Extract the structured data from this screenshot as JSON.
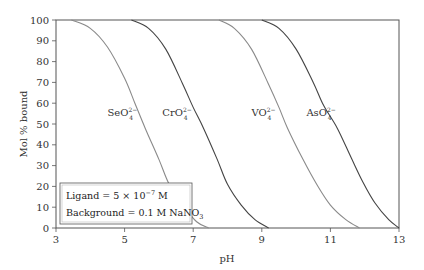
{
  "chart_data": {
    "type": "line",
    "title": "",
    "xlabel": "pH",
    "ylabel": "Mol % bound",
    "xlim": [
      3,
      13
    ],
    "ylim": [
      0,
      100
    ],
    "xticks": [
      3,
      5,
      7,
      9,
      11,
      13
    ],
    "yticks": [
      0,
      10,
      20,
      30,
      40,
      50,
      60,
      70,
      80,
      90,
      100
    ],
    "grid": false,
    "series": [
      {
        "name": "SeO4 2-",
        "label_main": "SeO",
        "label_sub": "4",
        "label_sup": "2−",
        "label_pos": [
          4.5,
          47
        ],
        "color": "#8a8a8a",
        "points": [
          [
            3.45,
            100
          ],
          [
            4.0,
            96
          ],
          [
            4.5,
            87
          ],
          [
            5.0,
            72
          ],
          [
            5.3,
            60
          ],
          [
            5.6,
            48
          ],
          [
            6.0,
            33
          ],
          [
            6.3,
            21
          ],
          [
            6.7,
            11
          ],
          [
            7.1,
            3
          ],
          [
            7.45,
            0
          ]
        ]
      },
      {
        "name": "CrO4 2-",
        "label_main": "CrO",
        "label_sub": "4",
        "label_sup": "2−",
        "label_pos": [
          6.1,
          47
        ],
        "color": "#444444",
        "points": [
          [
            5.2,
            100
          ],
          [
            5.7,
            96
          ],
          [
            6.2,
            86
          ],
          [
            6.7,
            69
          ],
          [
            7.0,
            58
          ],
          [
            7.3,
            48
          ],
          [
            7.7,
            33
          ],
          [
            8.0,
            21
          ],
          [
            8.4,
            11
          ],
          [
            8.8,
            4
          ],
          [
            9.2,
            0
          ]
        ]
      },
      {
        "name": "VO4 2-",
        "label_main": "VO",
        "label_sub": "4",
        "label_sup": "2−",
        "label_pos": [
          8.7,
          47
        ],
        "color": "#8a8a8a",
        "points": [
          [
            7.75,
            100
          ],
          [
            8.2,
            96
          ],
          [
            8.7,
            86
          ],
          [
            9.2,
            69
          ],
          [
            9.5,
            58
          ],
          [
            9.75,
            48
          ],
          [
            10.2,
            33
          ],
          [
            10.6,
            21
          ],
          [
            11.0,
            11
          ],
          [
            11.45,
            4
          ],
          [
            11.85,
            0
          ]
        ]
      },
      {
        "name": "AsO4 2-",
        "label_main": "AsO",
        "label_sub": "4",
        "label_sup": "2−",
        "label_pos": [
          10.3,
          47
        ],
        "color": "#444444",
        "points": [
          [
            9.0,
            100
          ],
          [
            9.5,
            96
          ],
          [
            10.0,
            86
          ],
          [
            10.5,
            70
          ],
          [
            10.8,
            59
          ],
          [
            11.2,
            48
          ],
          [
            11.6,
            34
          ],
          [
            11.95,
            22
          ],
          [
            12.3,
            12
          ],
          [
            12.7,
            4
          ],
          [
            13.0,
            0
          ]
        ]
      }
    ],
    "annotations": [
      "Ligand = 5 × 10⁻⁷ M",
      "Background = 0.1 M NaNO₃"
    ],
    "legend_position": "lower-left"
  },
  "legend": {
    "line1_prefix": "Ligand = 5 × 10",
    "line1_sup": "−7",
    "line1_suffix": " M",
    "line2_prefix": "Background = 0.1 M NaNO",
    "line2_sub": "3"
  }
}
